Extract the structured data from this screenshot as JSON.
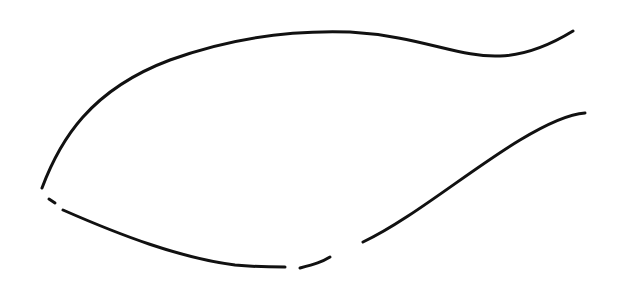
{
  "drawing": {
    "background": "#ffffff",
    "stroke_color": "#111111",
    "stroke_width": 3,
    "strokes": [
      {
        "name": "upper-body-curve",
        "d": "M 42 188 C 60 140, 90 90, 170 60 C 230 38, 290 30, 350 32 C 420 36, 460 58, 500 56 C 530 55, 555 42, 573 31"
      },
      {
        "name": "lower-right-curve",
        "d": "M 363 242 C 410 220, 470 170, 520 140 C 550 122, 570 114, 585 113"
      },
      {
        "name": "lower-dash-tail-right",
        "d": "M 300 268 C 315 264, 322 262, 330 257"
      },
      {
        "name": "lower-body-curve",
        "d": "M 63 210 C 120 235, 180 258, 235 265 C 255 267, 270 267, 285 267"
      },
      {
        "name": "mouth-dash",
        "d": "M 49 199 L 55 203"
      }
    ]
  }
}
